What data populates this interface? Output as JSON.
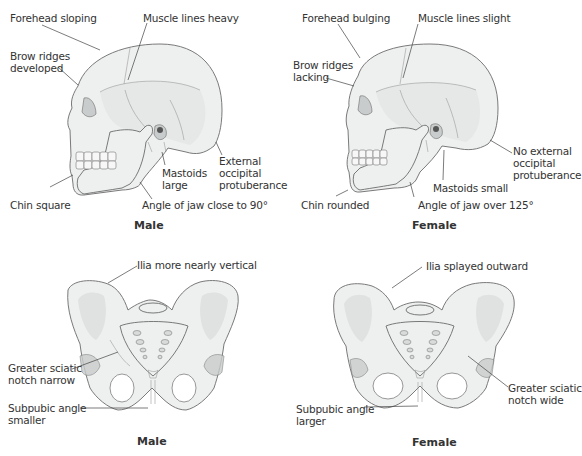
{
  "skulls": {
    "male": {
      "caption": "Male",
      "labels": {
        "forehead": "Forehead sloping",
        "muscle": "Muscle lines heavy",
        "brow_1": "Brow ridges",
        "brow_2": "developed",
        "mastoid_1": "Mastoids",
        "mastoid_2": "large",
        "occipital_1": "External",
        "occipital_2": "occipital",
        "occipital_3": "protuberance",
        "chin": "Chin square",
        "jaw": "Angle of jaw close to 90°"
      }
    },
    "female": {
      "caption": "Female",
      "labels": {
        "forehead": "Forehead bulging",
        "muscle": "Muscle lines slight",
        "brow_1": "Brow ridges",
        "brow_2": "lacking",
        "mastoid": "Mastoids small",
        "occipital_1": "No external",
        "occipital_2": "occipital",
        "occipital_3": "protuberance",
        "chin": "Chin rounded",
        "jaw": "Angle of jaw over 125°"
      }
    }
  },
  "pelves": {
    "male": {
      "caption": "Male",
      "labels": {
        "ilia": "Ilia more nearly vertical",
        "sciatic_1": "Greater sciatic",
        "sciatic_2": "notch narrow",
        "subpubic_1": "Subpubic angle",
        "subpubic_2": "smaller"
      }
    },
    "female": {
      "caption": "Female",
      "labels": {
        "ilia": "Ilia splayed outward",
        "sciatic_1": "Greater sciatic",
        "sciatic_2": "notch wide",
        "subpubic_1": "Subpubic angle",
        "subpubic_2": "larger"
      }
    }
  }
}
